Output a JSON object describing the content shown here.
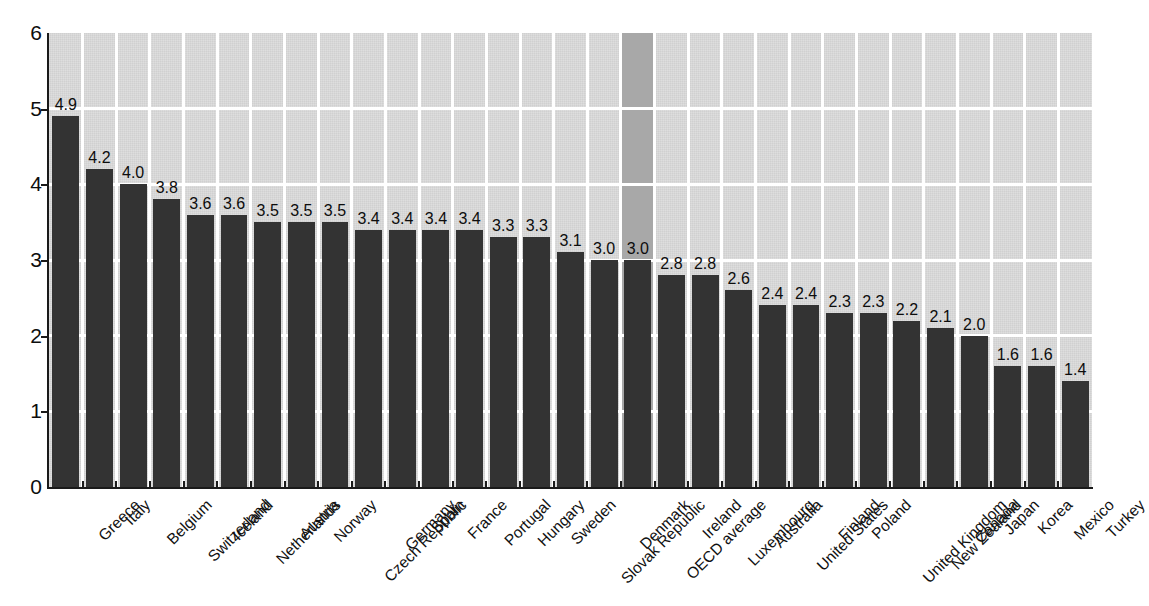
{
  "chart_data": {
    "type": "bar",
    "title": "",
    "subtitle": "",
    "xlabel": "",
    "ylabel": "",
    "ylim": [
      0,
      6
    ],
    "ytick_values": [
      0,
      1,
      2,
      3,
      4,
      5,
      6
    ],
    "ytick_labels": [
      "0",
      "1",
      "2",
      "3",
      "4",
      "5",
      "6"
    ],
    "grid": true,
    "grid_orientation": "both",
    "legend": false,
    "legend_position": "none",
    "value_labels_shown": true,
    "highlighted_category": "OECD average",
    "categories": [
      "Greece",
      "Italy",
      "Belgium",
      "Switzerland",
      "Iceland",
      "Netherlands",
      "Austria",
      "Norway",
      "Czech Republic",
      "Germany",
      "Spain",
      "France",
      "Portugal",
      "Hungary",
      "Sweden",
      "Slovak Republic",
      "Denmark",
      "OECD average",
      "Ireland",
      "Luxembourg",
      "Australia",
      "United States",
      "Finland",
      "Poland",
      "United Kingdom",
      "New Zealand",
      "Canada",
      "Japan",
      "Korea",
      "Mexico",
      "Turkey"
    ],
    "values": [
      4.9,
      4.2,
      4.0,
      3.8,
      3.6,
      3.6,
      3.5,
      3.5,
      3.5,
      3.4,
      3.4,
      3.4,
      3.4,
      3.3,
      3.3,
      3.1,
      3.0,
      3.0,
      2.8,
      2.8,
      2.6,
      2.4,
      2.4,
      2.3,
      2.3,
      2.2,
      2.1,
      2.0,
      1.6,
      1.6,
      1.4
    ],
    "value_labels": [
      "4.9",
      "4.2",
      "4.0",
      "3.8",
      "3.6",
      "3.6",
      "3.5",
      "3.5",
      "3.5",
      "3.4",
      "3.4",
      "3.4",
      "3.4",
      "3.3",
      "3.3",
      "3.1",
      "3.0",
      "3.0",
      "2.8",
      "2.8",
      "2.6",
      "2.4",
      "2.4",
      "2.3",
      "2.3",
      "2.2",
      "2.1",
      "2.0",
      "1.6",
      "1.6",
      "1.4"
    ],
    "colors": {
      "bar": "#333333",
      "plot_background": "#d0d0d0",
      "highlight_band": "#a8a8a8",
      "gridline": "#ffffff",
      "axis": "#1a1a1a",
      "text": "#0d0d0d"
    }
  }
}
